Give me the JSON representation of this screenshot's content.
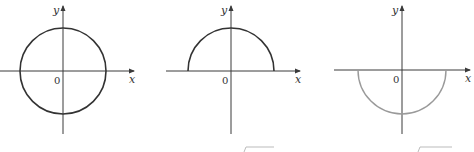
{
  "figures": [
    {
      "id": "full-circle",
      "curve": "circle",
      "equation": "x^2 + y^2 = 1",
      "x_label": "x",
      "y_label": "y",
      "origin_label": "0",
      "curve_color": "#333333"
    },
    {
      "id": "upper-semicircle",
      "curve": "upper-semicircle",
      "equation": "y = sqrt(1 - x^2)",
      "x_label": "x",
      "y_label": "y",
      "origin_label": "0",
      "curve_color": "#333333"
    },
    {
      "id": "lower-semicircle",
      "curve": "lower-semicircle",
      "equation": "y = -sqrt(1 - x^2)",
      "x_label": "x",
      "y_label": "y",
      "origin_label": "0",
      "curve_color": "#9a9a9a"
    }
  ]
}
